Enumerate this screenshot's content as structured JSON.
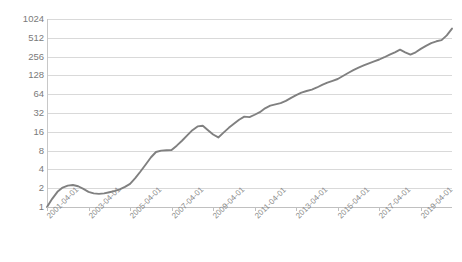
{
  "chart_data": {
    "type": "line",
    "title": "",
    "xlabel": "",
    "ylabel": "",
    "grid": true,
    "legend": "none",
    "yscale": "log2",
    "ylim": [
      1,
      1024
    ],
    "ytick_labels": [
      "1024",
      "512",
      "256",
      "128",
      "64",
      "32",
      "16",
      "8",
      "4",
      "2",
      "1"
    ],
    "ytick_values": [
      1024,
      512,
      256,
      128,
      64,
      32,
      16,
      8,
      4,
      2,
      1
    ],
    "xtick_labels": [
      "2001-04-01",
      "2003-04-01",
      "2005-04-01",
      "2007-04-01",
      "2009-04-01",
      "2011-04-01",
      "2013-04-01",
      "2015-04-01",
      "2017-04-01",
      "2019-04-01"
    ],
    "xlim": [
      "2001-04-01",
      "2020-10-01"
    ],
    "series": [
      {
        "name": "value",
        "color": "#808080",
        "x": [
          "2001-04-01",
          "2001-07-01",
          "2001-10-01",
          "2002-01-01",
          "2002-04-01",
          "2002-07-01",
          "2002-10-01",
          "2003-01-01",
          "2003-04-01",
          "2003-07-01",
          "2003-10-01",
          "2004-01-01",
          "2004-04-01",
          "2004-07-01",
          "2004-10-01",
          "2005-01-01",
          "2005-04-01",
          "2005-07-01",
          "2005-10-01",
          "2006-01-01",
          "2006-04-01",
          "2006-07-01",
          "2006-10-01",
          "2007-01-01",
          "2007-04-01",
          "2007-07-01",
          "2007-10-01",
          "2008-01-01",
          "2008-04-01",
          "2008-07-01",
          "2008-10-01",
          "2009-01-01",
          "2009-04-01",
          "2009-07-01",
          "2009-10-01",
          "2010-01-01",
          "2010-04-01",
          "2010-07-01",
          "2010-10-01",
          "2011-01-01",
          "2011-04-01",
          "2011-07-01",
          "2011-10-01",
          "2012-01-01",
          "2012-04-01",
          "2012-07-01",
          "2012-10-01",
          "2013-01-01",
          "2013-04-01",
          "2013-07-01",
          "2013-10-01",
          "2014-01-01",
          "2014-04-01",
          "2014-07-01",
          "2014-10-01",
          "2015-01-01",
          "2015-04-01",
          "2015-07-01",
          "2015-10-01",
          "2016-01-01",
          "2016-04-01",
          "2016-07-01",
          "2016-10-01",
          "2017-01-01",
          "2017-04-01",
          "2017-07-01",
          "2017-10-01",
          "2018-01-01",
          "2018-04-01",
          "2018-07-01",
          "2018-10-01",
          "2019-01-01",
          "2019-04-01",
          "2019-07-01",
          "2019-10-01",
          "2020-01-01",
          "2020-04-01",
          "2020-07-01",
          "2020-10-01"
        ],
        "values": [
          1.0,
          1.35,
          1.75,
          2.05,
          2.2,
          2.25,
          2.15,
          1.95,
          1.75,
          1.65,
          1.62,
          1.65,
          1.72,
          1.8,
          1.92,
          2.1,
          2.35,
          2.9,
          3.7,
          4.8,
          6.2,
          7.6,
          8.0,
          8.1,
          8.2,
          9.6,
          11.5,
          14.0,
          17.0,
          19.5,
          20.0,
          17.0,
          14.5,
          13.0,
          15.5,
          18.5,
          21.5,
          25.0,
          28.0,
          27.5,
          30.0,
          33.0,
          38.0,
          42.0,
          44.0,
          46.0,
          50.0,
          56.0,
          62.0,
          68.0,
          72.0,
          76.0,
          82.0,
          90.0,
          98.0,
          105.0,
          112.0,
          125.0,
          140.0,
          155.0,
          170.0,
          185.0,
          200.0,
          215.0,
          230.0,
          250.0,
          275.0,
          300.0,
          330.0,
          300.0,
          275.0,
          300.0,
          340.0,
          380.0,
          420.0,
          450.0,
          470.0,
          560.0,
          720.0
        ]
      }
    ]
  },
  "title_strip": {
    "clipped_text": ""
  }
}
